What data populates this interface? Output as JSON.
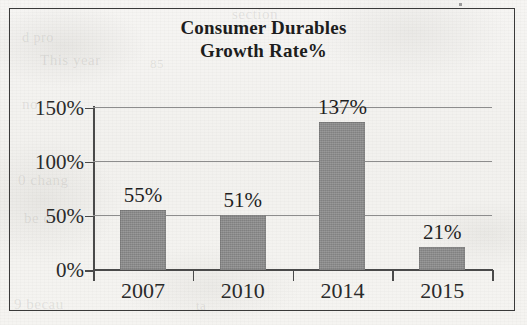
{
  "chart_data": {
    "type": "bar",
    "title": "Consumer Durables Growth Rate%",
    "title_line1": "Consumer Durables",
    "title_line2": "Growth Rate%",
    "categories": [
      "2007",
      "2010",
      "2014",
      "2015"
    ],
    "values": [
      55,
      51,
      137,
      21
    ],
    "data_labels": [
      "55%",
      "51%",
      "137%",
      "21%"
    ],
    "xlabel": "",
    "ylabel": "",
    "ylim": [
      0,
      150
    ],
    "ytick_values": [
      0,
      50,
      100,
      150
    ],
    "ytick_labels": [
      "0%",
      "50%",
      "100%",
      "150%"
    ],
    "grid": true,
    "legend": "none",
    "bar_color": "#8a8a8a",
    "axis_color": "#4a4a4a",
    "gridline_color": "#8d8d8d",
    "background_color": "#f4f3f1",
    "frame_color": "#3a3a3a",
    "text_color": "#1f1f1f"
  },
  "ghost_text": [
    {
      "text": "section",
      "x": 232,
      "y": 6,
      "size": 15
    },
    {
      "text": "d pro",
      "x": 22,
      "y": 30,
      "size": 14
    },
    {
      "text": "This year",
      "x": 40,
      "y": 52,
      "size": 15
    },
    {
      "text": "85",
      "x": 150,
      "y": 56,
      "size": 13
    },
    {
      "text": "no",
      "x": 22,
      "y": 96,
      "size": 15
    },
    {
      "text": "10",
      "x": 330,
      "y": 100,
      "size": 13
    },
    {
      "text": "0 chang",
      "x": 18,
      "y": 172,
      "size": 15
    },
    {
      "text": "be of",
      "x": 24,
      "y": 210,
      "size": 15
    },
    {
      "text": "9 becau",
      "x": 14,
      "y": 296,
      "size": 15
    },
    {
      "text": "ta",
      "x": 196,
      "y": 298,
      "size": 13
    }
  ]
}
